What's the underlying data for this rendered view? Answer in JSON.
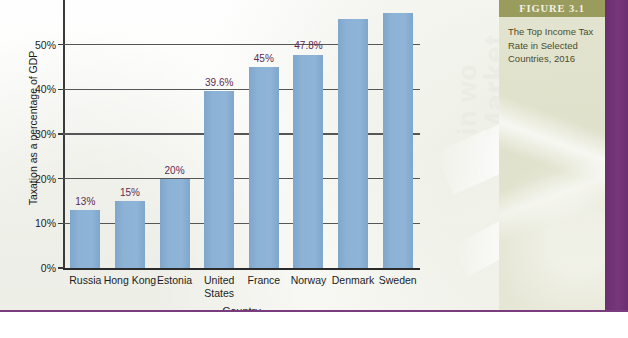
{
  "figure": {
    "header_label": "FIGURE 3.1",
    "caption": "The Top Income Tax Rate in Selected Countries, 2016"
  },
  "watermark": {
    "word_market": "Market",
    "word_in": "in wo",
    "word_small": "Diesel"
  },
  "colors": {
    "bar": "#8cb2d6",
    "data_label": "#5c2b55",
    "figure_header_bg": "#9a9c5e",
    "figure_panel_bg": "#e3e4cf",
    "purple_rule": "#7b3b7f",
    "axis": "#2b2b2b",
    "gridline": "#565656"
  },
  "chart_data": {
    "type": "bar",
    "title": "The Top Income Tax Rate in Selected Countries, 2016",
    "xlabel": "Country",
    "ylabel": "Taxation as a percentage of GDP",
    "ylim": [
      0,
      60
    ],
    "yticks": [
      0,
      10,
      20,
      30,
      40,
      50
    ],
    "ytick_labels": [
      "0%",
      "10%",
      "20%",
      "30%",
      "40%",
      "50%"
    ],
    "grid": true,
    "legend": "none",
    "axis_note": "Denmark and Sweden bars extend above the visible top crop of the image",
    "categories": [
      "Russia",
      "Hong Kong",
      "Estonia",
      "United\nStates",
      "France",
      "Norway",
      "Denmark",
      "Sweden"
    ],
    "values": [
      13,
      15,
      20,
      39.6,
      45,
      47.8,
      55.8,
      57
    ],
    "data_labels": [
      "13%",
      "15%",
      "20%",
      "39.6%",
      "45%",
      "47.8%",
      "",
      ""
    ]
  }
}
